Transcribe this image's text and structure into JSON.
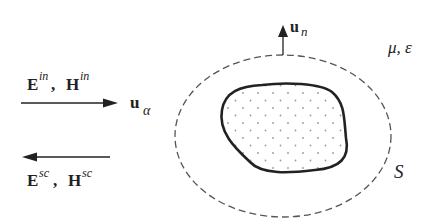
{
  "diagram": {
    "labels": {
      "incident_E": "E",
      "incident_E_sup": "in",
      "incident_sep": ", ",
      "incident_H": "H",
      "incident_H_sup": "in",
      "scattered_E": "E",
      "scattered_E_sup": "sc",
      "scattered_sep": ", ",
      "scattered_H": "H",
      "scattered_H_sup": "sc",
      "direction_u": "u",
      "direction_sub": "α",
      "normal_u": "u",
      "normal_sub": "n",
      "medium": "μ, ε",
      "surface": "S"
    },
    "colors": {
      "stroke": "#222222",
      "dashed": "#555555",
      "dots": "#999999",
      "background": "#ffffff"
    }
  }
}
